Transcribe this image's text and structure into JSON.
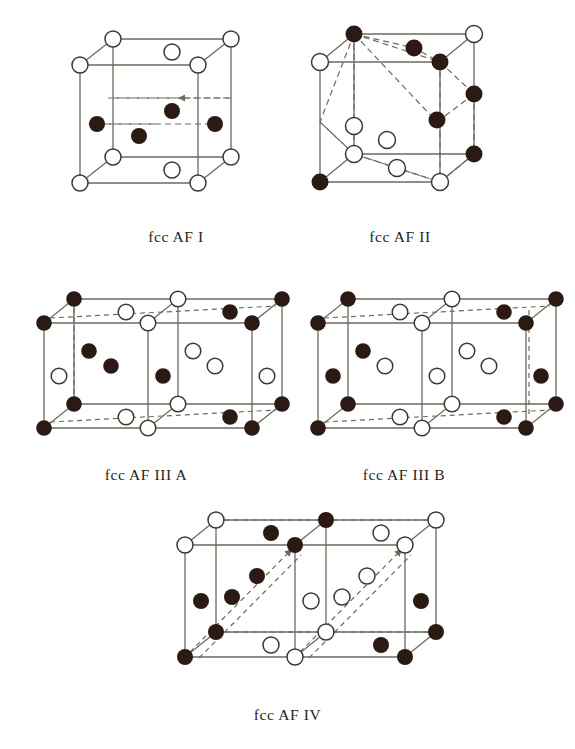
{
  "figure": {
    "title": "",
    "background_color": "#ffffff",
    "line_color": "#6b6b5f",
    "filled_atom_color": "#2a1a13",
    "open_atom_fill": "#ffffff",
    "open_atom_stroke": "#3a3a33",
    "atom_radius": 7.5,
    "legend": {
      "filled_meaning": "spin-down atom",
      "open_meaning": "spin-up atom"
    }
  },
  "panels": [
    {
      "id": "fcc-af-1",
      "caption": "fcc AF I",
      "caption_x": 176,
      "caption_y": 236,
      "cell_type": "single-cube",
      "description": "fcc antiferromagnetic type I ordering: alternating (001) ferromagnetic sheets",
      "origin_x": 80,
      "origin_y": 65,
      "cube_w": 118,
      "cube_h": 118,
      "depth_x": 33,
      "depth_y": -26,
      "dashed_plane": "mid-height horizontal square with arrows",
      "atoms": [
        {
          "u": 0,
          "v": 0,
          "w": 0,
          "type": "open"
        },
        {
          "u": 1,
          "v": 0,
          "w": 0,
          "type": "open"
        },
        {
          "u": 0,
          "v": 0,
          "w": 1,
          "type": "open"
        },
        {
          "u": 1,
          "v": 0,
          "w": 1,
          "type": "open"
        },
        {
          "u": 0.5,
          "v": 0,
          "w": 1,
          "type": "open"
        },
        {
          "u": 0,
          "v": 1,
          "w": 0,
          "type": "open"
        },
        {
          "u": 1,
          "v": 1,
          "w": 0,
          "type": "open"
        },
        {
          "u": 0,
          "v": 1,
          "w": 1,
          "type": "open"
        },
        {
          "u": 1,
          "v": 1,
          "w": 1,
          "type": "open"
        },
        {
          "u": 0.5,
          "v": 1,
          "w": 1,
          "type": "open"
        },
        {
          "u": 0,
          "v": 0.5,
          "w": 0.5,
          "type": "filled"
        },
        {
          "u": 1,
          "v": 0.5,
          "w": 0.5,
          "type": "filled"
        },
        {
          "u": 0.5,
          "v": 0.5,
          "w": 0,
          "type": "filled"
        },
        {
          "u": 0.5,
          "v": 0.5,
          "w": 1,
          "type": "filled"
        }
      ]
    },
    {
      "id": "fcc-af-2",
      "caption": "fcc AF II",
      "caption_x": 400,
      "caption_y": 236,
      "cell_type": "single-cube",
      "description": "fcc antiferromagnetic type II ordering: alternating (111) ferromagnetic sheets",
      "origin_x": 320,
      "origin_y": 62,
      "cube_w": 120,
      "cube_h": 120,
      "depth_x": 34,
      "depth_y": -28,
      "dashed_plane": "two (111) triangular planes",
      "atoms": [
        {
          "u": 0,
          "v": 0,
          "w": 0,
          "type": "filled"
        },
        {
          "u": 1,
          "v": 0,
          "w": 0,
          "type": "open"
        },
        {
          "u": 0,
          "v": 0,
          "w": 1,
          "type": "open"
        },
        {
          "u": 1,
          "v": 0,
          "w": 1,
          "type": "filled"
        },
        {
          "u": 0.5,
          "v": 0,
          "w": 1,
          "type": "open"
        },
        {
          "u": 0,
          "v": 1,
          "w": 0,
          "type": "filled"
        },
        {
          "u": 1,
          "v": 1,
          "w": 0,
          "type": "open"
        },
        {
          "u": 0,
          "v": 1,
          "w": 1,
          "type": "open"
        },
        {
          "u": 1,
          "v": 1,
          "w": 1,
          "type": "filled"
        },
        {
          "u": 0.5,
          "v": 1,
          "w": 1,
          "type": "filled"
        },
        {
          "u": 0,
          "v": 0.5,
          "w": 0.5,
          "type": "open"
        },
        {
          "u": 1,
          "v": 0.5,
          "w": 0.5,
          "type": "filled"
        },
        {
          "u": 0.5,
          "v": 0.5,
          "w": 0,
          "type": "open"
        },
        {
          "u": 0.5,
          "v": 0.5,
          "w": 1,
          "type": "filled"
        }
      ]
    },
    {
      "id": "fcc-af-3a",
      "caption": "fcc AF III A",
      "caption_x": 146,
      "caption_y": 474,
      "cell_type": "double-cube",
      "description": "fcc antiferromagnetic type III A ordering in a doubled cell",
      "origin_x": 44,
      "origin_y": 323,
      "cube_w": 104,
      "cube_h": 105,
      "depth_x": 30,
      "depth_y": -24,
      "atoms": [],
      "atom_count_filled": 17,
      "atom_count_open": 13
    },
    {
      "id": "fcc-af-3b",
      "caption": "fcc AF III B",
      "caption_x": 404,
      "caption_y": 474,
      "cell_type": "double-cube",
      "description": "fcc antiferromagnetic type III B ordering in a doubled cell",
      "origin_x": 318,
      "origin_y": 323,
      "cube_w": 104,
      "cube_h": 105,
      "depth_x": 30,
      "depth_y": -24,
      "atoms": [],
      "atom_count_filled": 17,
      "atom_count_open": 13
    },
    {
      "id": "fcc-af-4",
      "caption": "fcc AF IV",
      "caption_x": 287,
      "caption_y": 714,
      "cell_type": "double-cube",
      "description": "fcc antiferromagnetic type IV ordering in a doubled cell with diagonal spin planes",
      "origin_x": 185,
      "origin_y": 545,
      "cube_w": 110,
      "cube_h": 112,
      "depth_x": 31,
      "depth_y": -25,
      "atoms": [],
      "atom_count_filled": 15,
      "atom_count_open": 15
    }
  ]
}
